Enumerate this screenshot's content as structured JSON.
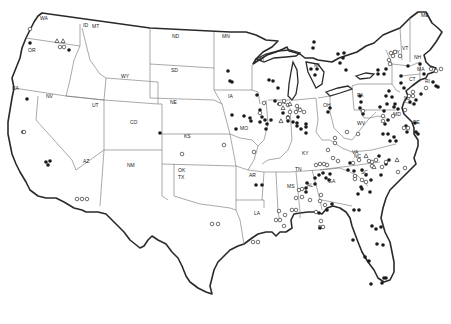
{
  "map": {
    "title": "",
    "region": "Contiguous United States",
    "colors": {
      "outline": "#2a2a2a",
      "state_border": "#707070",
      "marker": "#1a1a1a",
      "background": "#ffffff"
    },
    "state_labels": [
      {
        "code": "WA",
        "x": 40,
        "y": 20
      },
      {
        "code": "ID",
        "x": 83,
        "y": 27
      },
      {
        "code": "MT",
        "x": 92,
        "y": 28
      },
      {
        "code": "OR",
        "x": 28,
        "y": 52
      },
      {
        "code": "WY",
        "x": 121,
        "y": 78
      },
      {
        "code": "ND",
        "x": 172,
        "y": 38
      },
      {
        "code": "MN",
        "x": 222,
        "y": 38
      },
      {
        "code": "SD",
        "x": 171,
        "y": 72
      },
      {
        "code": "WI",
        "x": 258,
        "y": 61
      },
      {
        "code": "MI",
        "x": 314,
        "y": 67
      },
      {
        "code": "NY",
        "x": 393,
        "y": 54
      },
      {
        "code": "VT",
        "x": 402,
        "y": 50
      },
      {
        "code": "ME",
        "x": 421,
        "y": 17
      },
      {
        "code": "NH",
        "x": 414,
        "y": 59
      },
      {
        "code": "MA",
        "x": 417,
        "y": 71
      },
      {
        "code": "CT",
        "x": 409,
        "y": 81
      },
      {
        "code": "RI",
        "x": 425,
        "y": 83
      },
      {
        "code": "NJ",
        "x": 404,
        "y": 100
      },
      {
        "code": "PA",
        "x": 357,
        "y": 97
      },
      {
        "code": "DE",
        "x": 413,
        "y": 124
      },
      {
        "code": "MD",
        "x": 393,
        "y": 116
      },
      {
        "code": "OH",
        "x": 323,
        "y": 107
      },
      {
        "code": "IN",
        "x": 296,
        "y": 111
      },
      {
        "code": "IL",
        "x": 282,
        "y": 104
      },
      {
        "code": "IA",
        "x": 228,
        "y": 98
      },
      {
        "code": "NE",
        "x": 170,
        "y": 104
      },
      {
        "code": "MO",
        "x": 240,
        "y": 130
      },
      {
        "code": "KS",
        "x": 184,
        "y": 138
      },
      {
        "code": "CO",
        "x": 130,
        "y": 124
      },
      {
        "code": "UT",
        "x": 92,
        "y": 107
      },
      {
        "code": "NV",
        "x": 46,
        "y": 98
      },
      {
        "code": "CA",
        "x": 12,
        "y": 90
      },
      {
        "code": "AZ",
        "x": 83,
        "y": 163
      },
      {
        "code": "NM",
        "x": 127,
        "y": 167
      },
      {
        "code": "OK",
        "x": 178,
        "y": 172
      },
      {
        "code": "TX",
        "x": 178,
        "y": 179
      },
      {
        "code": "AR",
        "x": 249,
        "y": 177
      },
      {
        "code": "KY",
        "x": 302,
        "y": 155
      },
      {
        "code": "WV",
        "x": 357,
        "y": 125
      },
      {
        "code": "VA",
        "x": 352,
        "y": 154
      },
      {
        "code": "NC",
        "x": 354,
        "y": 158
      },
      {
        "code": "TN",
        "x": 295,
        "y": 171
      },
      {
        "code": "SC",
        "x": 361,
        "y": 174
      },
      {
        "code": "GA",
        "x": 328,
        "y": 183
      },
      {
        "code": "AL",
        "x": 307,
        "y": 187
      },
      {
        "code": "MS",
        "x": 287,
        "y": 188
      },
      {
        "code": "LA",
        "x": 254,
        "y": 215
      },
      {
        "code": "FL",
        "x": 318,
        "y": 229
      }
    ],
    "legend": null,
    "markers": {
      "filled": [
        [
          30,
          43
        ],
        [
          69,
          50
        ],
        [
          27,
          99
        ],
        [
          23,
          132
        ],
        [
          46,
          162
        ],
        [
          50,
          161
        ],
        [
          48,
          165
        ],
        [
          160,
          133
        ],
        [
          228,
          71
        ],
        [
          230,
          81
        ],
        [
          232,
          82
        ],
        [
          257,
          95
        ],
        [
          269,
          80
        ],
        [
          273,
          81
        ],
        [
          278,
          88
        ],
        [
          260,
          110
        ],
        [
          232,
          115
        ],
        [
          236,
          129
        ],
        [
          256,
          185
        ],
        [
          262,
          185
        ],
        [
          244,
          116
        ],
        [
          250,
          118
        ],
        [
          251,
          121
        ],
        [
          260,
          122
        ],
        [
          262,
          117
        ],
        [
          265,
          120
        ],
        [
          267,
          124
        ],
        [
          266,
          129
        ],
        [
          271,
          120
        ],
        [
          314,
          42
        ],
        [
          313,
          48
        ],
        [
          311,
          69
        ],
        [
          317,
          69
        ],
        [
          315,
          75
        ],
        [
          338,
          54
        ],
        [
          344,
          53
        ],
        [
          343,
          58
        ],
        [
          340,
          63
        ],
        [
          346,
          70
        ],
        [
          378,
          70
        ],
        [
          378,
          74
        ],
        [
          386,
          69
        ],
        [
          384,
          74
        ],
        [
          401,
          76
        ],
        [
          401,
          83
        ],
        [
          404,
          88
        ],
        [
          408,
          66
        ],
        [
          420,
          64
        ],
        [
          424,
          74
        ],
        [
          433,
          82
        ],
        [
          436,
          86
        ],
        [
          438,
          87
        ],
        [
          389,
          91
        ],
        [
          386,
          96
        ],
        [
          392,
          97
        ],
        [
          387,
          104
        ],
        [
          394,
          107
        ],
        [
          395,
          104
        ],
        [
          398,
          109
        ],
        [
          380,
          107
        ],
        [
          384,
          111
        ],
        [
          388,
          120
        ],
        [
          385,
          124
        ],
        [
          410,
          102
        ],
        [
          414,
          104
        ],
        [
          416,
          100
        ],
        [
          421,
          94
        ],
        [
          415,
          123
        ],
        [
          416,
          132
        ],
        [
          418,
          134
        ],
        [
          383,
          134
        ],
        [
          388,
          134
        ],
        [
          390,
          141
        ],
        [
          396,
          141
        ],
        [
          394,
          137
        ],
        [
          406,
          126
        ],
        [
          407,
          132
        ],
        [
          363,
          114
        ],
        [
          360,
          108
        ],
        [
          361,
          102
        ],
        [
          360,
          96
        ],
        [
          330,
          108
        ],
        [
          328,
          112
        ],
        [
          306,
          124
        ],
        [
          297,
          123
        ],
        [
          297,
          126
        ],
        [
          301,
          129
        ],
        [
          306,
          127
        ],
        [
          306,
          133
        ],
        [
          275,
          101
        ],
        [
          279,
          104
        ],
        [
          283,
          113
        ],
        [
          288,
          117
        ],
        [
          288,
          121
        ],
        [
          293,
          122
        ],
        [
          298,
          117
        ],
        [
          379,
          156
        ],
        [
          386,
          164
        ],
        [
          389,
          160
        ],
        [
          362,
          170
        ],
        [
          366,
          175
        ],
        [
          371,
          180
        ],
        [
          350,
          163
        ],
        [
          348,
          170
        ],
        [
          354,
          171
        ],
        [
          361,
          187
        ],
        [
          362,
          189
        ],
        [
          370,
          192
        ],
        [
          358,
          194
        ],
        [
          376,
          229
        ],
        [
          381,
          227
        ],
        [
          383,
          245
        ],
        [
          377,
          244
        ],
        [
          372,
          226
        ],
        [
          320,
          228
        ],
        [
          319,
          213
        ],
        [
          327,
          210
        ],
        [
          354,
          210
        ],
        [
          359,
          210
        ],
        [
          332,
          204
        ],
        [
          353,
          240
        ],
        [
          365,
          257
        ],
        [
          369,
          261
        ],
        [
          371,
          284
        ],
        [
          384,
          278
        ],
        [
          382,
          283
        ],
        [
          386,
          278
        ],
        [
          326,
          178
        ],
        [
          323,
          173
        ],
        [
          319,
          175
        ],
        [
          315,
          178
        ],
        [
          315,
          184
        ],
        [
          330,
          174
        ],
        [
          329,
          180
        ],
        [
          307,
          183
        ],
        [
          306,
          188
        ],
        [
          306,
          192
        ],
        [
          381,
          175
        ]
      ],
      "open": [
        [
          30,
          29
        ],
        [
          60,
          47
        ],
        [
          64,
          47
        ],
        [
          24,
          132
        ],
        [
          77,
          199
        ],
        [
          82,
          199
        ],
        [
          87,
          199
        ],
        [
          182,
          154
        ],
        [
          254,
          152
        ],
        [
          224,
          145
        ],
        [
          212,
          224
        ],
        [
          218,
          224
        ],
        [
          253,
          242
        ],
        [
          258,
          242
        ],
        [
          276,
          220
        ],
        [
          280,
          220
        ],
        [
          284,
          226
        ],
        [
          285,
          215
        ],
        [
          279,
          211
        ],
        [
          296,
          198
        ],
        [
          302,
          197
        ],
        [
          310,
          200
        ],
        [
          316,
          212
        ],
        [
          321,
          221
        ],
        [
          323,
          227
        ],
        [
          299,
          190
        ],
        [
          302,
          189
        ],
        [
          324,
          164
        ],
        [
          320,
          164
        ],
        [
          328,
          150
        ],
        [
          335,
          143
        ],
        [
          335,
          138
        ],
        [
          358,
          134
        ],
        [
          347,
          132
        ],
        [
          363,
          111
        ],
        [
          390,
          64
        ],
        [
          389,
          60
        ],
        [
          393,
          56
        ],
        [
          391,
          53
        ],
        [
          395,
          52
        ],
        [
          400,
          56
        ],
        [
          431,
          69
        ],
        [
          436,
          71
        ],
        [
          441,
          69
        ],
        [
          409,
          96
        ],
        [
          413,
          96
        ],
        [
          413,
          92
        ],
        [
          426,
          88
        ],
        [
          408,
          128
        ],
        [
          404,
          128
        ],
        [
          405,
          110
        ],
        [
          393,
          116
        ],
        [
          383,
          116
        ],
        [
          383,
          121
        ],
        [
          359,
          160
        ],
        [
          353,
          163
        ],
        [
          327,
          165
        ],
        [
          316,
          165
        ],
        [
          280,
          104
        ],
        [
          284,
          101
        ],
        [
          288,
          105
        ],
        [
          290,
          112
        ],
        [
          288,
          118
        ],
        [
          296,
          112
        ],
        [
          304,
          112
        ],
        [
          300,
          110
        ],
        [
          297,
          106
        ],
        [
          260,
          113
        ],
        [
          264,
          103
        ],
        [
          321,
          195
        ],
        [
          320,
          201
        ],
        [
          325,
          205
        ],
        [
          338,
          161
        ],
        [
          333,
          158
        ],
        [
          369,
          161
        ],
        [
          372,
          166
        ],
        [
          382,
          167
        ],
        [
          386,
          162
        ],
        [
          398,
          172
        ],
        [
          405,
          168
        ],
        [
          292,
          210
        ],
        [
          296,
          210
        ],
        [
          355,
          176
        ],
        [
          362,
          180
        ],
        [
          366,
          182
        ],
        [
          355,
          179
        ],
        [
          372,
          162
        ],
        [
          376,
          160
        ]
      ],
      "triangles": [
        [
          57,
          41
        ],
        [
          63,
          41
        ],
        [
          283,
          108
        ],
        [
          290,
          104
        ],
        [
          366,
          156
        ],
        [
          374,
          167
        ],
        [
          397,
          160
        ],
        [
          281,
          121
        ]
      ]
    }
  }
}
